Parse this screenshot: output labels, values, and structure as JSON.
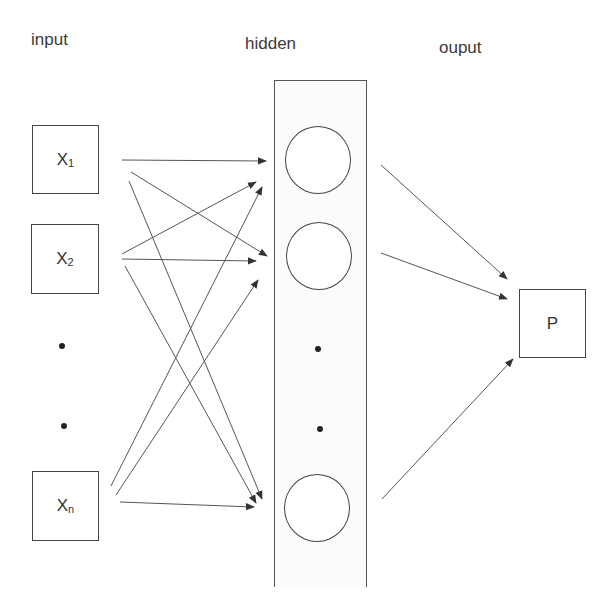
{
  "layers": {
    "input": {
      "title": "input"
    },
    "hidden": {
      "title": "hidden"
    },
    "output": {
      "title": "ouput"
    }
  },
  "nodes": {
    "input": [
      {
        "main": "X",
        "sub": "1"
      },
      {
        "main": "X",
        "sub": "2"
      },
      {
        "main": "X",
        "sub": "n"
      }
    ],
    "output": {
      "label": "P"
    }
  },
  "ellipsis": "vertical dots between X2 and Xn, and between hidden neurons 2 and last",
  "colors": {
    "stroke": "#444444",
    "background": "#ffffff"
  }
}
